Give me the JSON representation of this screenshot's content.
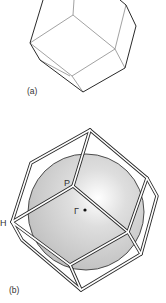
{
  "panels": [
    {
      "id": "a",
      "label": "(a)",
      "description": "Rhombic dodecahedron (wireframe)"
    },
    {
      "id": "b",
      "label": "(b)",
      "description": "Rhombic dodecahedron enclosing a shaded sphere"
    }
  ],
  "points": {
    "P": "P",
    "H": "H",
    "Gamma": "Γ"
  },
  "colors": {
    "edge_dark": "#2a2a2a",
    "edge_light": "#8a8a8a",
    "sphere_fill": "#cfcfcf",
    "sphere_highlight": "#ffffff",
    "band_fill": "#ffffff"
  }
}
